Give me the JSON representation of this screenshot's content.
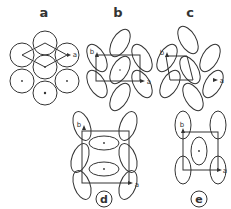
{
  "panels": {
    "a": {
      "label": "a",
      "axis_a": "a"
    },
    "b": {
      "label": "b",
      "axis_a": "a",
      "axis_b": "b"
    },
    "c": {
      "label": "c",
      "axis_a": "a",
      "axis_b": "b"
    },
    "d": {
      "label": "d",
      "axis_a": "a",
      "axis_b": "b"
    },
    "e": {
      "label": "e",
      "axis_a": "a",
      "axis_b": "b"
    }
  },
  "colors": {
    "stroke": "#333333",
    "background": "#ffffff"
  }
}
